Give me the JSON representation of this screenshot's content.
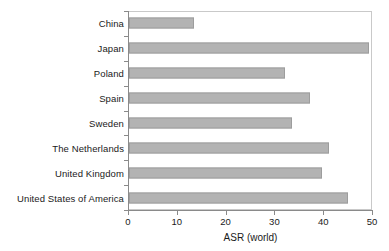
{
  "chart_data": {
    "type": "bar",
    "orientation": "horizontal",
    "title": "",
    "xlabel": "ASR (world)",
    "ylabel": "",
    "xlim": [
      0,
      50
    ],
    "xticks": [
      0,
      10,
      20,
      30,
      40,
      50
    ],
    "grid": false,
    "legend": null,
    "categories": [
      "China",
      "Japan",
      "Poland",
      "Spain",
      "Sweden",
      "The Netherlands",
      "United Kingdom",
      "United States of America"
    ],
    "values": [
      13.3,
      49.2,
      32.0,
      37.0,
      33.5,
      41.0,
      39.5,
      44.8
    ],
    "bar_color": "#b3b3b3",
    "bar_border_color": "#9d9d9d",
    "axis_color": "#8a8a8a",
    "plot_border_color": "#c9c9c9",
    "text_color": "#1a1a1a"
  }
}
